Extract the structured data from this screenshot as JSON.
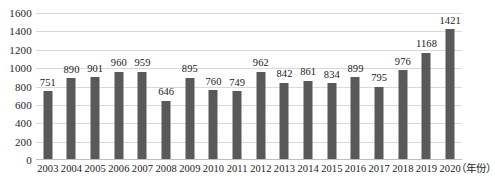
{
  "chart_data": {
    "type": "bar",
    "title": "",
    "subtitle": "",
    "xlabel": "（年份）",
    "ylabel": "",
    "categories": [
      "2003",
      "2004",
      "2005",
      "2006",
      "2007",
      "2008",
      "2009",
      "2010",
      "2011",
      "2012",
      "2013",
      "2014",
      "2015",
      "2016",
      "2017",
      "2018",
      "2019",
      "2020"
    ],
    "values": [
      751,
      890,
      901,
      960,
      959,
      646,
      895,
      760,
      749,
      962,
      842,
      861,
      834,
      899,
      795,
      976,
      1168,
      1421
    ],
    "ylim": [
      0,
      1600
    ],
    "yticks": [
      0,
      200,
      400,
      600,
      800,
      1000,
      1200,
      1400,
      1600
    ],
    "ytick_labels": [
      "0",
      "200",
      "400",
      "600",
      "800",
      "1000",
      "1200",
      "1400",
      "1600"
    ],
    "grid": true,
    "legend": false,
    "legend_position": "none",
    "data_labels": true,
    "bar_color": "#595959",
    "gridline_color": "#d9d9d9",
    "text_color": "#1a1a1a",
    "background_color": "#ffffff"
  }
}
